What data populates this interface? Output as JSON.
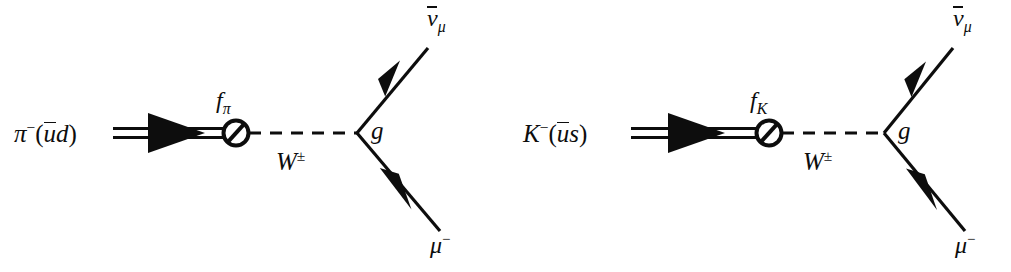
{
  "figure": {
    "kind": "feynman-diagram-pair",
    "background_color": "#ffffff",
    "ink_color": "#0d0d0d",
    "width": 1011,
    "height": 272
  },
  "diagrams": [
    {
      "id": "pion-leptonic-decay",
      "initial_state": {
        "particle": "π",
        "charge": "−",
        "quark_content_open": "(",
        "quark_antiquark": "u",
        "quark_second": "d",
        "quark_content_close": ")",
        "full_label": "π−(ūd)"
      },
      "decay_constant": {
        "symbol": "f",
        "subscript": "π",
        "full_label": "fπ",
        "blob": "slashed-circle"
      },
      "mediator": {
        "symbol": "W",
        "superscript": "±",
        "full_label": "W±",
        "line_style": "dashed"
      },
      "coupling": {
        "symbol": "g",
        "full_label": "g"
      },
      "final_states": [
        {
          "symbol": "ν",
          "subscript": "μ",
          "antiparticle": true,
          "full_label": "ν̄μ",
          "position": "upper-right",
          "arrow_direction": "incoming-to-vertex"
        },
        {
          "symbol": "μ",
          "charge": "−",
          "antiparticle": false,
          "full_label": "μ−",
          "position": "lower-right",
          "arrow_direction": "outgoing-from-vertex"
        }
      ]
    },
    {
      "id": "kaon-leptonic-decay",
      "initial_state": {
        "particle": "K",
        "charge": "−",
        "quark_content_open": "(",
        "quark_antiquark": "u",
        "quark_second": "s",
        "quark_content_close": ")",
        "full_label": "K−(ūs)"
      },
      "decay_constant": {
        "symbol": "f",
        "subscript": "K",
        "full_label": "fK",
        "blob": "slashed-circle"
      },
      "mediator": {
        "symbol": "W",
        "superscript": "±",
        "full_label": "W±",
        "line_style": "dashed"
      },
      "coupling": {
        "symbol": "g",
        "full_label": "g"
      },
      "final_states": [
        {
          "symbol": "ν",
          "subscript": "μ",
          "antiparticle": true,
          "full_label": "ν̄μ",
          "position": "upper-right",
          "arrow_direction": "incoming-to-vertex"
        },
        {
          "symbol": "μ",
          "charge": "−",
          "antiparticle": false,
          "full_label": "μ−",
          "position": "lower-right",
          "arrow_direction": "outgoing-from-vertex"
        }
      ]
    }
  ],
  "glyphs": {
    "pi": "π",
    "nu": "ν",
    "mu": "μ",
    "minus": "−",
    "plusminus": "±",
    "f": "f",
    "g": "g",
    "W": "W",
    "K": "K",
    "u": "u",
    "d": "d",
    "s": "s",
    "paren_open": "(",
    "paren_close": ")"
  }
}
